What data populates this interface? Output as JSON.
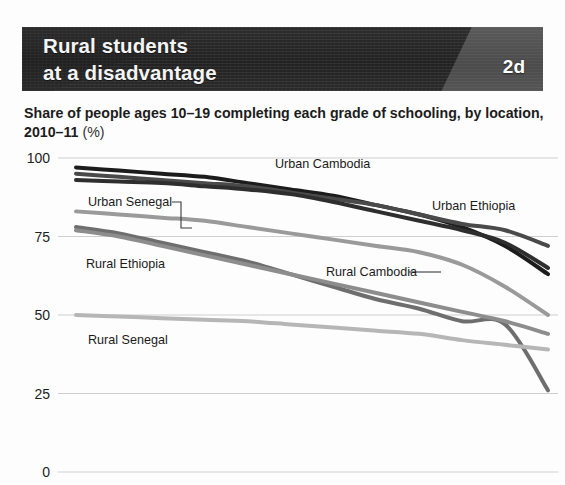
{
  "banner": {
    "title": "Rural students\nat a disadvantage",
    "tag": "2d",
    "bg_color": "#262626",
    "tag_panel_color": "#555555",
    "title_color": "#f4f4f4"
  },
  "subtitle": {
    "main": "Share of people ages 10–19 completing each grade of schooling, by location, 2010–11",
    "line1": "Share of people ages 10–19 completing each grade of schooling,",
    "line2": "by location, 2010–11",
    "unit": "(%)"
  },
  "chart_data": {
    "type": "line",
    "title": "Rural students at a disadvantage",
    "subtitle": "Share of people ages 10–19 completing each grade of schooling, by location, 2010–11 (%)",
    "xlabel": "",
    "ylabel": "",
    "ylim": [
      0,
      100
    ],
    "yticks": [
      100,
      75,
      50,
      25,
      0
    ],
    "ytick_labels": [
      "100",
      "75",
      "50",
      "25",
      "0"
    ],
    "grid": true,
    "grid_axis": "y",
    "legend": "inline-labels",
    "x": [
      1,
      2,
      3,
      4,
      5,
      6,
      7,
      8,
      9,
      10,
      11,
      12
    ],
    "series": [
      {
        "name": "Urban Cambodia",
        "color": "#1c1c1c",
        "label_x": 275,
        "label_y": 168,
        "values": [
          97,
          96,
          95,
          94,
          92,
          90,
          88,
          85,
          82,
          78,
          72,
          63
        ]
      },
      {
        "name": "Urban Ethiopia",
        "color": "#4a4a4a",
        "label_x": 432,
        "label_y": 210,
        "values": [
          95,
          94,
          93,
          92,
          91,
          89,
          87,
          85,
          82,
          79,
          77,
          72
        ]
      },
      {
        "name": "Urban Cambodia secondary",
        "color": "#2e2e2e",
        "label_x": null,
        "label_y": null,
        "values": [
          93,
          92.5,
          92,
          91,
          90,
          88.5,
          86,
          83,
          80,
          77,
          73,
          65
        ]
      },
      {
        "name": "Urban Senegal",
        "color": "#9a9a9a",
        "label_x": 88,
        "label_y": 206,
        "values": [
          83,
          82,
          81,
          80,
          78,
          76,
          74,
          72,
          70,
          66,
          59,
          50
        ]
      },
      {
        "name": "Rural Ethiopia",
        "color": "#6e6e6e",
        "label_x": 86,
        "label_y": 268,
        "values": [
          78,
          76,
          73,
          70,
          67,
          63,
          59,
          55,
          52,
          48,
          47,
          26
        ]
      },
      {
        "name": "Rural Cambodia",
        "color": "#8d8d8d",
        "label_x": 326,
        "label_y": 276,
        "values": [
          77,
          75,
          72,
          69,
          66,
          63,
          60,
          57,
          54,
          51,
          48,
          44
        ]
      },
      {
        "name": "Rural Senegal",
        "color": "#b6b6b6",
        "label_x": 88,
        "label_y": 344,
        "values": [
          50,
          49.5,
          49,
          48.5,
          48,
          47,
          46,
          45,
          44,
          42,
          40.5,
          39
        ]
      }
    ]
  }
}
